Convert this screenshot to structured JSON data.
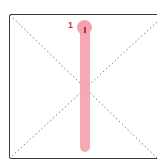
{
  "diagram": {
    "frame_color": "#3a3a3a",
    "diagonal_color": "#7a7a7a",
    "bar_color": "#f4a3ad",
    "marker_label": "1",
    "marker_label_color": "#d63346"
  }
}
